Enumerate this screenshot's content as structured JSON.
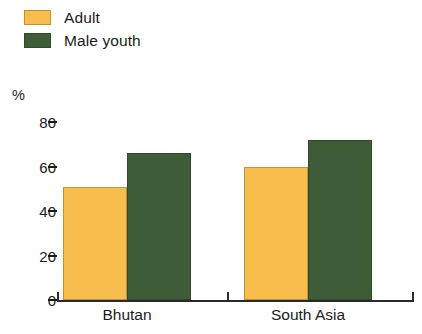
{
  "legend": {
    "items": [
      {
        "label": "Adult",
        "color": "#F7BD4D",
        "key": "adult"
      },
      {
        "label": "Male youth",
        "color": "#3E5C38",
        "key": "male_youth"
      }
    ]
  },
  "axis": {
    "unit_label": "%",
    "ticks": [
      "80",
      "60",
      "40",
      "20",
      "0"
    ]
  },
  "categories": {
    "bhutan": "Bhutan",
    "south_asia": "South Asia"
  },
  "chart_data": {
    "type": "bar",
    "title": "",
    "subtitle": "",
    "xlabel": "",
    "ylabel": "%",
    "ylim": [
      0,
      80
    ],
    "yticks": [
      0,
      20,
      40,
      60,
      80
    ],
    "grid": false,
    "legend_position": "top-left",
    "categories": [
      "Bhutan",
      "South Asia"
    ],
    "series": [
      {
        "name": "Adult",
        "color": "#F7BD4D",
        "values": [
          51,
          60
        ]
      },
      {
        "name": "Male youth",
        "color": "#3E5C38",
        "values": [
          66,
          72
        ]
      }
    ]
  }
}
